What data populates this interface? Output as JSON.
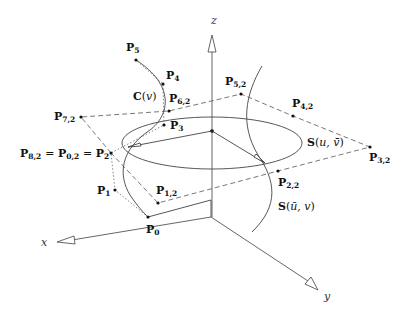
{
  "diagram": {
    "type": "3d-nurbs-surface-of-revolution",
    "axes": {
      "x": {
        "label": "x"
      },
      "y": {
        "label": "y"
      },
      "z": {
        "label": "z"
      }
    },
    "curves": {
      "generatrix": {
        "label": "C(v)",
        "base": "C",
        "param": "v"
      },
      "surface_iso_u": {
        "label": "S(u, v̄)",
        "base": "S",
        "param": "u, v̄"
      },
      "surface_iso_v": {
        "label": "S(ū, v)",
        "base": "S",
        "param": "ū, v"
      }
    },
    "control_points": {
      "P0": {
        "main": "P",
        "sub": "0"
      },
      "P1": {
        "main": "P",
        "sub": "1"
      },
      "P2_eq": {
        "text": "P8,2 = P0,2 = P2",
        "parts": [
          {
            "main": "P",
            "sub": "8,2"
          },
          {
            "main": "P",
            "sub": "0,2"
          },
          {
            "main": "P",
            "sub": "2"
          }
        ],
        "sep": "="
      },
      "P3": {
        "main": "P",
        "sub": "3"
      },
      "P4": {
        "main": "P",
        "sub": "4"
      },
      "P5": {
        "main": "P",
        "sub": "5"
      },
      "P12": {
        "main": "P",
        "sub": "1,2"
      },
      "P22": {
        "main": "P",
        "sub": "2,2"
      },
      "P32": {
        "main": "P",
        "sub": "3,2"
      },
      "P42": {
        "main": "P",
        "sub": "4,2"
      },
      "P52": {
        "main": "P",
        "sub": "5,2"
      },
      "P62": {
        "main": "P",
        "sub": "6,2"
      },
      "P72": {
        "main": "P",
        "sub": "7,2"
      }
    }
  }
}
